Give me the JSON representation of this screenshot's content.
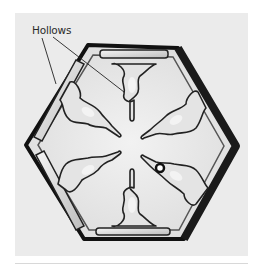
{
  "figure": {
    "annotation": {
      "label": "Hollows",
      "leader_lines": 2
    },
    "colors": {
      "page_background": "#ffffff",
      "photo_background": "#ebebeb",
      "crystal_outline": "#111111",
      "label_text": "#2a2a2a",
      "divider": "#d8d8d8"
    }
  }
}
